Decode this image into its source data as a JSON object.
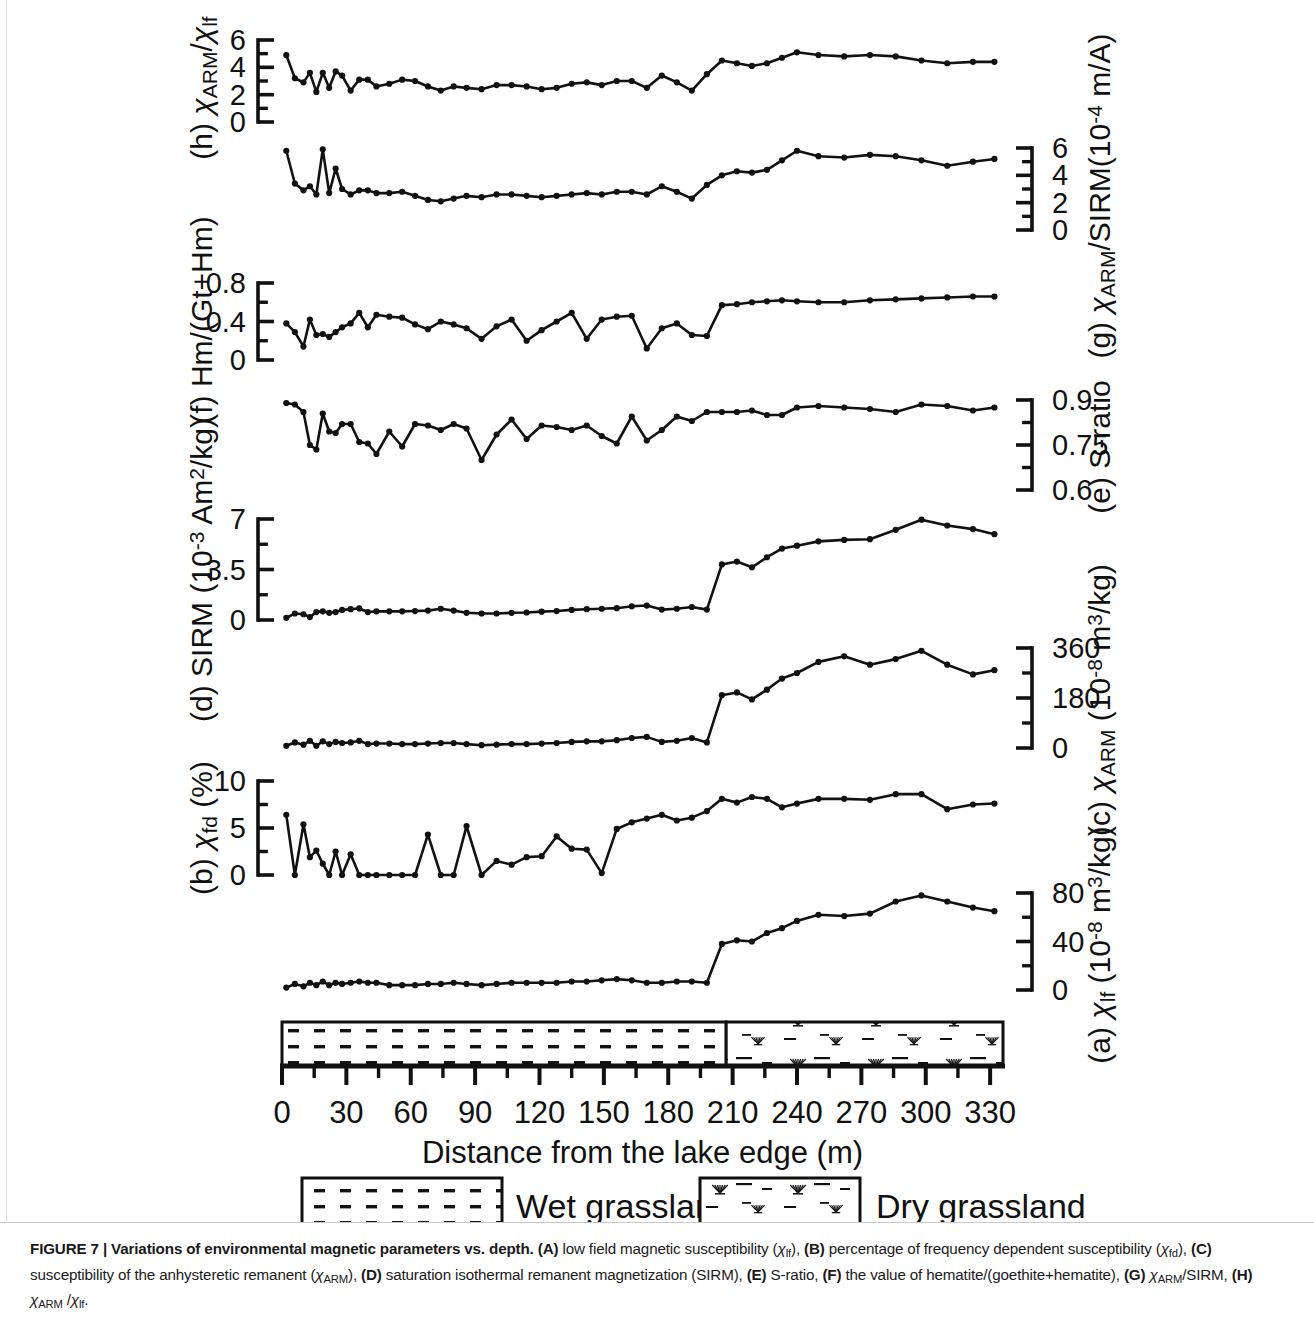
{
  "figure": {
    "label": "FIGURE 7",
    "caption_title": "Variations of environmental magnetic parameters vs. depth.",
    "caption_full": "FIGURE 7 | Variations of environmental magnetic parameters vs. depth. (A) low field magnetic susceptibility (χlf), (B) percentage of frequency dependent susceptibility (χfd), (C) susceptibility of the anhysteretic remanent (χARM), (D) saturation isothermal remanent magnetization (SIRM), (E) S-ratio, (F) the value of hematite/(goethite+hematite), (G) χARM/SIRM, (H) χARM /χlf."
  },
  "xaxis": {
    "title": "Distance from the lake edge (m)",
    "ticks": [
      0,
      30,
      60,
      90,
      120,
      150,
      180,
      210,
      240,
      270,
      300,
      330
    ],
    "min": 0,
    "max": 336,
    "minor_step": 15
  },
  "legend": {
    "items": [
      {
        "label": "Wet grassland",
        "pattern": "dashes"
      },
      {
        "label": "Dry grassland",
        "pattern": "tufts"
      }
    ]
  },
  "lithology": {
    "boundary_m": 207,
    "left_unit": "Wet grassland",
    "right_unit": "Dry grassland"
  },
  "chart_data": [
    {
      "id": "h",
      "type": "line",
      "panel_letter": "(h)",
      "label_html": "(h) χARM/χlf",
      "label_plain": "(h) χARM/χlf",
      "axis_side": "left",
      "ylim": [
        0,
        6
      ],
      "ticks": [
        0,
        2,
        4,
        6
      ],
      "minor_ticks": [
        1,
        3,
        5
      ],
      "xlabel": "Distance from the lake edge (m)",
      "ylabel": "χARM/χlf",
      "x": [
        2,
        6,
        10,
        13,
        16,
        19,
        22,
        25,
        28,
        32,
        36,
        40,
        44,
        50,
        56,
        62,
        68,
        74,
        80,
        86,
        93,
        100,
        107,
        114,
        121,
        128,
        135,
        142,
        149,
        156,
        163,
        170,
        177,
        184,
        191,
        198,
        205,
        212,
        219,
        226,
        233,
        240,
        250,
        262,
        274,
        286,
        298,
        310,
        322,
        332
      ],
      "values": [
        4.9,
        3.2,
        2.9,
        3.6,
        2.2,
        3.6,
        2.5,
        3.7,
        3.4,
        2.3,
        3.1,
        3.1,
        2.6,
        2.8,
        3.1,
        3.0,
        2.6,
        2.3,
        2.6,
        2.5,
        2.4,
        2.7,
        2.7,
        2.6,
        2.4,
        2.5,
        2.8,
        2.9,
        2.7,
        3.0,
        3.0,
        2.5,
        3.4,
        2.9,
        2.3,
        3.5,
        4.5,
        4.3,
        4.1,
        4.3,
        4.7,
        5.1,
        4.9,
        4.8,
        4.9,
        4.8,
        4.5,
        4.3,
        4.4,
        4.4
      ]
    },
    {
      "id": "g",
      "type": "line",
      "panel_letter": "(g)",
      "label_html": "(g) χARM/SIRM(10⁻⁴ m/A)",
      "label_plain": "(g) χARM/SIRM(10-4 m/A)",
      "axis_side": "right",
      "ylim": [
        0,
        6
      ],
      "ticks": [
        0,
        2,
        4,
        6
      ],
      "minor_ticks": [
        1,
        3,
        5
      ],
      "ylabel": "χARM/SIRM(10⁻⁴ m/A)",
      "x": [
        2,
        6,
        10,
        13,
        16,
        19,
        22,
        25,
        28,
        32,
        36,
        40,
        44,
        50,
        56,
        62,
        68,
        74,
        80,
        86,
        93,
        100,
        107,
        114,
        121,
        128,
        135,
        142,
        149,
        156,
        163,
        170,
        177,
        184,
        191,
        198,
        205,
        212,
        219,
        226,
        233,
        240,
        250,
        262,
        274,
        286,
        298,
        310,
        322,
        332
      ],
      "values": [
        5.8,
        3.4,
        2.9,
        3.2,
        2.6,
        5.9,
        2.7,
        4.5,
        3.0,
        2.6,
        2.9,
        2.9,
        2.7,
        2.7,
        2.8,
        2.5,
        2.2,
        2.1,
        2.3,
        2.5,
        2.4,
        2.6,
        2.6,
        2.5,
        2.4,
        2.5,
        2.6,
        2.7,
        2.6,
        2.8,
        2.8,
        2.6,
        3.2,
        2.8,
        2.3,
        3.3,
        4.0,
        4.3,
        4.2,
        4.4,
        5.1,
        5.8,
        5.4,
        5.3,
        5.5,
        5.4,
        5.1,
        4.7,
        5.0,
        5.2
      ]
    },
    {
      "id": "f",
      "type": "line",
      "panel_letter": "(f)",
      "label_html": "(f) Hm/(Gt+Hm)",
      "label_plain": "(f) Hm/(Gt+Hm)",
      "axis_side": "left",
      "ylim": [
        0,
        0.8
      ],
      "ticks": [
        0,
        0.4,
        0.8
      ],
      "minor_ticks": [
        0.2,
        0.6
      ],
      "ylabel": "Hm/(Gt+Hm)",
      "x": [
        2,
        6,
        10,
        13,
        16,
        19,
        22,
        25,
        28,
        32,
        36,
        40,
        44,
        50,
        56,
        62,
        68,
        74,
        80,
        86,
        93,
        100,
        107,
        114,
        121,
        128,
        135,
        142,
        149,
        156,
        163,
        170,
        177,
        184,
        191,
        198,
        205,
        212,
        219,
        226,
        233,
        240,
        250,
        262,
        274,
        286,
        298,
        310,
        322,
        332
      ],
      "values": [
        0.38,
        0.29,
        0.14,
        0.42,
        0.26,
        0.27,
        0.24,
        0.29,
        0.34,
        0.38,
        0.49,
        0.34,
        0.47,
        0.45,
        0.44,
        0.37,
        0.32,
        0.4,
        0.37,
        0.33,
        0.22,
        0.35,
        0.42,
        0.2,
        0.31,
        0.4,
        0.49,
        0.22,
        0.42,
        0.45,
        0.46,
        0.12,
        0.33,
        0.38,
        0.26,
        0.25,
        0.57,
        0.58,
        0.6,
        0.61,
        0.62,
        0.61,
        0.6,
        0.6,
        0.62,
        0.63,
        0.64,
        0.65,
        0.66,
        0.66
      ]
    },
    {
      "id": "e",
      "type": "line",
      "panel_letter": "(e)",
      "label_html": "(e) S-ratio",
      "label_plain": "(e) S-ratio",
      "axis_side": "right",
      "ylim": [
        0.6,
        0.9
      ],
      "ticks": [
        0.6,
        0.75,
        0.9
      ],
      "minor_ticks": [
        0.675,
        0.825
      ],
      "ylabel": "S-ratio",
      "x": [
        2,
        6,
        10,
        13,
        16,
        19,
        22,
        25,
        28,
        32,
        36,
        40,
        44,
        50,
        56,
        62,
        68,
        74,
        80,
        86,
        93,
        100,
        107,
        114,
        121,
        128,
        135,
        142,
        149,
        156,
        163,
        170,
        177,
        184,
        191,
        198,
        205,
        212,
        219,
        226,
        233,
        240,
        250,
        262,
        274,
        286,
        298,
        310,
        322,
        332
      ],
      "values": [
        0.89,
        0.885,
        0.86,
        0.75,
        0.735,
        0.855,
        0.795,
        0.79,
        0.82,
        0.82,
        0.76,
        0.755,
        0.72,
        0.795,
        0.745,
        0.82,
        0.815,
        0.8,
        0.82,
        0.805,
        0.7,
        0.785,
        0.835,
        0.77,
        0.815,
        0.81,
        0.8,
        0.815,
        0.78,
        0.755,
        0.845,
        0.765,
        0.8,
        0.845,
        0.83,
        0.86,
        0.86,
        0.86,
        0.865,
        0.85,
        0.85,
        0.875,
        0.88,
        0.875,
        0.87,
        0.86,
        0.885,
        0.88,
        0.865,
        0.875
      ]
    },
    {
      "id": "d",
      "type": "line",
      "panel_letter": "(d)",
      "label_html": "(d) SIRM (10⁻³ Am²/kg)",
      "label_plain": "(d) SIRM (10-3 Am2/kg)",
      "axis_side": "left",
      "ylim": [
        0,
        7
      ],
      "ticks": [
        0,
        3.5,
        7
      ],
      "minor_ticks": [
        1.75,
        5.25
      ],
      "ylabel": "SIRM (10⁻³ Am²/kg)",
      "x": [
        2,
        6,
        10,
        13,
        16,
        19,
        22,
        25,
        28,
        32,
        36,
        40,
        44,
        50,
        56,
        62,
        68,
        74,
        80,
        86,
        93,
        100,
        107,
        114,
        121,
        128,
        135,
        142,
        149,
        156,
        163,
        170,
        177,
        184,
        191,
        198,
        205,
        212,
        219,
        226,
        233,
        240,
        250,
        262,
        274,
        286,
        298,
        310,
        322,
        332
      ],
      "values": [
        0.15,
        0.45,
        0.4,
        0.2,
        0.55,
        0.6,
        0.5,
        0.55,
        0.7,
        0.75,
        0.8,
        0.55,
        0.6,
        0.6,
        0.6,
        0.62,
        0.65,
        0.78,
        0.65,
        0.5,
        0.45,
        0.45,
        0.5,
        0.52,
        0.58,
        0.62,
        0.7,
        0.75,
        0.78,
        0.82,
        0.95,
        1.0,
        0.72,
        0.78,
        0.9,
        0.72,
        3.85,
        4.05,
        3.65,
        4.35,
        4.95,
        5.15,
        5.45,
        5.55,
        5.6,
        6.25,
        6.95,
        6.55,
        6.3,
        5.95
      ]
    },
    {
      "id": "c",
      "type": "line",
      "panel_letter": "(c)",
      "label_html": "(c) χARM (10⁻⁸ m³/kg)",
      "label_plain": "(c) χARM (10-8 m3/kg)",
      "axis_side": "right",
      "ylim": [
        0,
        360
      ],
      "ticks": [
        0,
        180,
        360
      ],
      "minor_ticks": [
        90,
        270
      ],
      "ylabel": "χARM (10⁻⁸ m³/kg)",
      "x": [
        2,
        6,
        10,
        13,
        16,
        19,
        22,
        25,
        28,
        32,
        36,
        40,
        44,
        50,
        56,
        62,
        68,
        74,
        80,
        86,
        93,
        100,
        107,
        114,
        121,
        128,
        135,
        142,
        149,
        156,
        163,
        170,
        177,
        184,
        191,
        198,
        205,
        212,
        219,
        226,
        233,
        240,
        250,
        262,
        274,
        286,
        298,
        310,
        322,
        332
      ],
      "values": [
        8,
        20,
        12,
        26,
        8,
        24,
        14,
        22,
        18,
        20,
        26,
        14,
        16,
        16,
        14,
        14,
        16,
        18,
        18,
        14,
        10,
        12,
        14,
        14,
        16,
        18,
        22,
        24,
        24,
        28,
        36,
        40,
        22,
        26,
        36,
        20,
        190,
        200,
        175,
        210,
        250,
        270,
        310,
        330,
        300,
        320,
        350,
        300,
        265,
        280
      ]
    },
    {
      "id": "b",
      "type": "line",
      "panel_letter": "(b)",
      "label_html": "(b) χfd (%)",
      "label_plain": "(b) χfd (%)",
      "axis_side": "left",
      "ylim": [
        0,
        10
      ],
      "ticks": [
        0,
        5,
        10
      ],
      "minor_ticks": [
        2.5,
        7.5
      ],
      "ylabel": "χfd (%)",
      "x": [
        2,
        6,
        10,
        13,
        16,
        19,
        22,
        25,
        28,
        32,
        36,
        40,
        44,
        50,
        56,
        62,
        68,
        74,
        80,
        86,
        93,
        100,
        107,
        114,
        121,
        128,
        135,
        142,
        149,
        156,
        163,
        170,
        177,
        184,
        191,
        198,
        205,
        212,
        219,
        226,
        233,
        240,
        250,
        262,
        274,
        286,
        298,
        310,
        322,
        332
      ],
      "values": [
        6.4,
        0.0,
        5.4,
        1.9,
        2.6,
        1.2,
        0.0,
        2.5,
        0.0,
        2.2,
        0.0,
        0.0,
        0.0,
        0.0,
        0.0,
        0.0,
        4.3,
        0.0,
        0.0,
        5.2,
        0.0,
        1.5,
        1.1,
        1.9,
        2.0,
        4.1,
        2.8,
        2.7,
        0.2,
        4.9,
        5.6,
        6.0,
        6.4,
        5.8,
        6.1,
        6.8,
        8.1,
        7.7,
        8.3,
        8.1,
        7.2,
        7.6,
        8.1,
        8.1,
        8.0,
        8.6,
        8.6,
        7.0,
        7.5,
        7.6
      ]
    },
    {
      "id": "a",
      "type": "line",
      "panel_letter": "(a)",
      "label_html": "(a) χlf (10⁻⁸ m³/kg)",
      "label_plain": "(a) χlf (10-8 m3/kg)",
      "axis_side": "right",
      "ylim": [
        0,
        80
      ],
      "ticks": [
        0,
        40,
        80
      ],
      "minor_ticks": [
        20,
        60
      ],
      "ylabel": "χlf (10⁻⁸ m³/kg)",
      "x": [
        2,
        6,
        10,
        13,
        16,
        19,
        22,
        25,
        28,
        32,
        36,
        40,
        44,
        50,
        56,
        62,
        68,
        74,
        80,
        86,
        93,
        100,
        107,
        114,
        121,
        128,
        135,
        142,
        149,
        156,
        163,
        170,
        177,
        184,
        191,
        198,
        205,
        212,
        219,
        226,
        233,
        240,
        250,
        262,
        274,
        286,
        298,
        310,
        322,
        332
      ],
      "values": [
        2,
        5,
        3,
        6,
        4,
        7,
        4,
        6,
        5,
        6,
        7,
        6,
        6,
        4,
        4,
        4,
        5,
        5,
        6,
        5,
        4,
        5,
        6,
        6,
        6,
        6,
        7,
        7,
        8,
        9,
        8,
        6,
        6,
        7,
        7,
        6,
        38,
        41,
        40,
        47,
        51,
        57,
        62,
        61,
        63,
        73,
        78,
        73,
        68,
        65
      ]
    }
  ]
}
